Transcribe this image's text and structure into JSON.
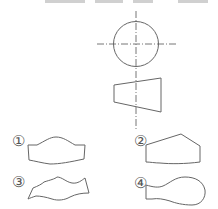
{
  "diagram": {
    "stroke_color": "#666666",
    "center_line_color": "#777777",
    "background": "#ffffff",
    "views": {
      "top_view": {
        "type": "circle",
        "cx": 136,
        "cy": 44,
        "r": 22.5
      },
      "front_view": {
        "type": "trapezoid",
        "points": "114,85 161,78 161,112 114,102"
      }
    },
    "options": [
      {
        "label": "①",
        "x": 18,
        "y": 141
      },
      {
        "label": "②",
        "x": 140,
        "y": 141
      },
      {
        "label": "③",
        "x": 18,
        "y": 182
      },
      {
        "label": "④",
        "x": 140,
        "y": 183
      }
    ]
  }
}
